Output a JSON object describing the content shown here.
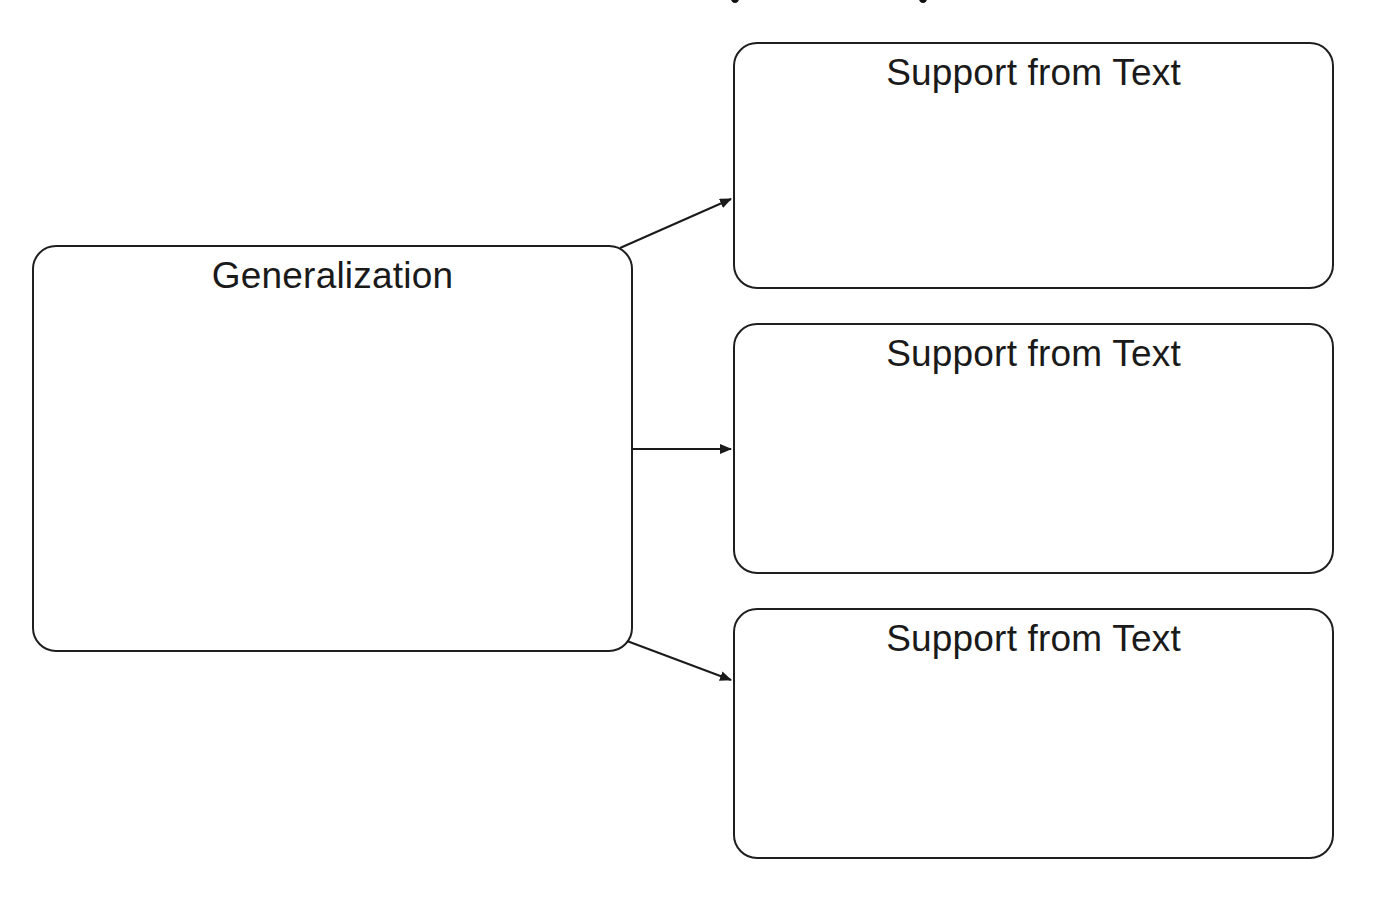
{
  "diagram": {
    "type": "graphic-organizer",
    "main_box": {
      "label": "Generalization"
    },
    "support_boxes": [
      {
        "label": "Support from Text"
      },
      {
        "label": "Support from Text"
      },
      {
        "label": "Support from Text"
      }
    ],
    "arrows": [
      {
        "from": "Generalization",
        "to": "Support from Text 1"
      },
      {
        "from": "Generalization",
        "to": "Support from Text 2"
      },
      {
        "from": "Generalization",
        "to": "Support from Text 3"
      }
    ],
    "colors": {
      "stroke": "#1f1f1f",
      "background": "#ffffff"
    }
  }
}
